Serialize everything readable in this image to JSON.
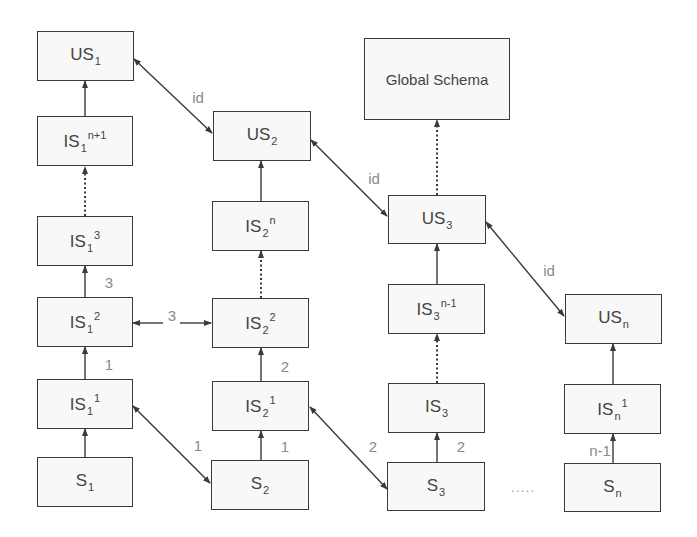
{
  "diagram": {
    "boxes": [
      {
        "id": "US1",
        "base": "US",
        "sub": "1",
        "sup": "",
        "x": 37,
        "y": 31,
        "w": 97,
        "h": 50
      },
      {
        "id": "IS1n1",
        "base": "IS",
        "sub": "1",
        "sup": "n+1",
        "x": 37,
        "y": 116,
        "w": 96,
        "h": 50
      },
      {
        "id": "IS13",
        "base": "IS",
        "sub": "1",
        "sup": "3",
        "x": 37,
        "y": 216,
        "w": 96,
        "h": 50
      },
      {
        "id": "IS12",
        "base": "IS",
        "sub": "1",
        "sup": "2",
        "x": 37,
        "y": 297,
        "w": 96,
        "h": 50
      },
      {
        "id": "IS11",
        "base": "IS",
        "sub": "1",
        "sup": "1",
        "x": 37,
        "y": 379,
        "w": 96,
        "h": 50
      },
      {
        "id": "S1",
        "base": "S",
        "sub": "1",
        "sup": "",
        "x": 37,
        "y": 457,
        "w": 96,
        "h": 50
      },
      {
        "id": "US2",
        "base": "US",
        "sub": "2",
        "sup": "",
        "x": 213,
        "y": 111,
        "w": 98,
        "h": 50
      },
      {
        "id": "IS2n",
        "base": "IS",
        "sub": "2",
        "sup": "n",
        "x": 212,
        "y": 201,
        "w": 97,
        "h": 50
      },
      {
        "id": "IS22",
        "base": "IS",
        "sub": "2",
        "sup": "2",
        "x": 212,
        "y": 298,
        "w": 97,
        "h": 50
      },
      {
        "id": "IS21",
        "base": "IS",
        "sub": "2",
        "sup": "1",
        "x": 212,
        "y": 381,
        "w": 97,
        "h": 50
      },
      {
        "id": "S2",
        "base": "S",
        "sub": "2",
        "sup": "",
        "x": 211,
        "y": 460,
        "w": 98,
        "h": 50
      },
      {
        "id": "GS",
        "base": "Global Schema",
        "sub": "",
        "sup": "",
        "x": 364,
        "y": 38,
        "w": 146,
        "h": 82
      },
      {
        "id": "US3",
        "base": "US",
        "sub": "3",
        "sup": "",
        "x": 388,
        "y": 195,
        "w": 98,
        "h": 49
      },
      {
        "id": "IS3n1",
        "base": "IS",
        "sub": "3",
        "sup": "n-1",
        "x": 388,
        "y": 284,
        "w": 97,
        "h": 50
      },
      {
        "id": "IS3",
        "base": "IS",
        "sub": "3",
        "sup": "",
        "x": 388,
        "y": 383,
        "w": 97,
        "h": 50
      },
      {
        "id": "S3",
        "base": "S",
        "sub": "3",
        "sup": "",
        "x": 387,
        "y": 462,
        "w": 98,
        "h": 49
      },
      {
        "id": "USn",
        "base": "US",
        "sub": "n",
        "sup": "",
        "x": 565,
        "y": 294,
        "w": 97,
        "h": 50
      },
      {
        "id": "ISn1",
        "base": "IS",
        "sub": "n",
        "sup": "1",
        "x": 564,
        "y": 384,
        "w": 97,
        "h": 50
      },
      {
        "id": "Sn",
        "base": "S",
        "sub": "n",
        "sup": "",
        "x": 564,
        "y": 463,
        "w": 97,
        "h": 49
      }
    ],
    "edges": [
      {
        "from": [
          85,
          116
        ],
        "to": [
          85,
          81
        ],
        "style": "solid",
        "heads": "end"
      },
      {
        "from": [
          85,
          216
        ],
        "to": [
          85,
          167
        ],
        "style": "dotted",
        "heads": "end"
      },
      {
        "from": [
          85,
          297
        ],
        "to": [
          85,
          266
        ],
        "style": "solid",
        "heads": "end"
      },
      {
        "from": [
          85,
          379
        ],
        "to": [
          85,
          347
        ],
        "style": "solid",
        "heads": "end"
      },
      {
        "from": [
          85,
          457
        ],
        "to": [
          85,
          429
        ],
        "style": "solid",
        "heads": "end"
      },
      {
        "from": [
          261,
          201
        ],
        "to": [
          261,
          161
        ],
        "style": "solid",
        "heads": "end"
      },
      {
        "from": [
          261,
          298
        ],
        "to": [
          261,
          251
        ],
        "style": "dotted",
        "heads": "end"
      },
      {
        "from": [
          261,
          381
        ],
        "to": [
          261,
          348
        ],
        "style": "solid",
        "heads": "end"
      },
      {
        "from": [
          261,
          460
        ],
        "to": [
          261,
          431
        ],
        "style": "solid",
        "heads": "end"
      },
      {
        "from": [
          437,
          195
        ],
        "to": [
          437,
          120
        ],
        "style": "dotted",
        "heads": "end"
      },
      {
        "from": [
          437,
          284
        ],
        "to": [
          437,
          244
        ],
        "style": "solid",
        "heads": "end"
      },
      {
        "from": [
          437,
          383
        ],
        "to": [
          437,
          334
        ],
        "style": "dotted",
        "heads": "end"
      },
      {
        "from": [
          437,
          462
        ],
        "to": [
          437,
          433
        ],
        "style": "solid",
        "heads": "end"
      },
      {
        "from": [
          613,
          384
        ],
        "to": [
          613,
          344
        ],
        "style": "solid",
        "heads": "end"
      },
      {
        "from": [
          613,
          463
        ],
        "to": [
          613,
          434
        ],
        "style": "solid",
        "heads": "end"
      },
      {
        "from": [
          134,
          59
        ],
        "to": [
          212,
          133
        ],
        "style": "solid",
        "heads": "both"
      },
      {
        "from": [
          311,
          140
        ],
        "to": [
          387,
          216
        ],
        "style": "solid",
        "heads": "both"
      },
      {
        "from": [
          486,
          222
        ],
        "to": [
          564,
          316
        ],
        "style": "solid",
        "heads": "both"
      },
      {
        "from": [
          133,
          323
        ],
        "to": [
          211,
          323
        ],
        "style": "solid",
        "heads": "both",
        "gap": [
          163,
          180
        ]
      },
      {
        "from": [
          133,
          406
        ],
        "to": [
          210,
          483
        ],
        "style": "solid",
        "heads": "both"
      },
      {
        "from": [
          310,
          407
        ],
        "to": [
          387,
          489
        ],
        "style": "solid",
        "heads": "both"
      }
    ],
    "edge_labels": [
      {
        "text": "id",
        "x": 198,
        "y": 97
      },
      {
        "text": "id",
        "x": 374,
        "y": 178
      },
      {
        "text": "id",
        "x": 549,
        "y": 270
      },
      {
        "text": "3",
        "x": 109,
        "y": 282
      },
      {
        "text": "3",
        "x": 172,
        "y": 315
      },
      {
        "text": "1",
        "x": 109,
        "y": 364
      },
      {
        "text": "1",
        "x": 198,
        "y": 445
      },
      {
        "text": "2",
        "x": 285,
        "y": 366
      },
      {
        "text": "1",
        "x": 285,
        "y": 446
      },
      {
        "text": "2",
        "x": 373,
        "y": 446
      },
      {
        "text": "2",
        "x": 461,
        "y": 446
      },
      {
        "text": "n-1",
        "x": 600,
        "y": 450
      }
    ],
    "ellipsis": {
      "text": ".....",
      "x": 523,
      "y": 487
    },
    "colors": {
      "box_border": "#3a3a3a",
      "box_fill": "#f8f8f8",
      "box_text": "#444444",
      "edge": "#3a3a3a",
      "edge_label": "#8a8a8a"
    }
  }
}
